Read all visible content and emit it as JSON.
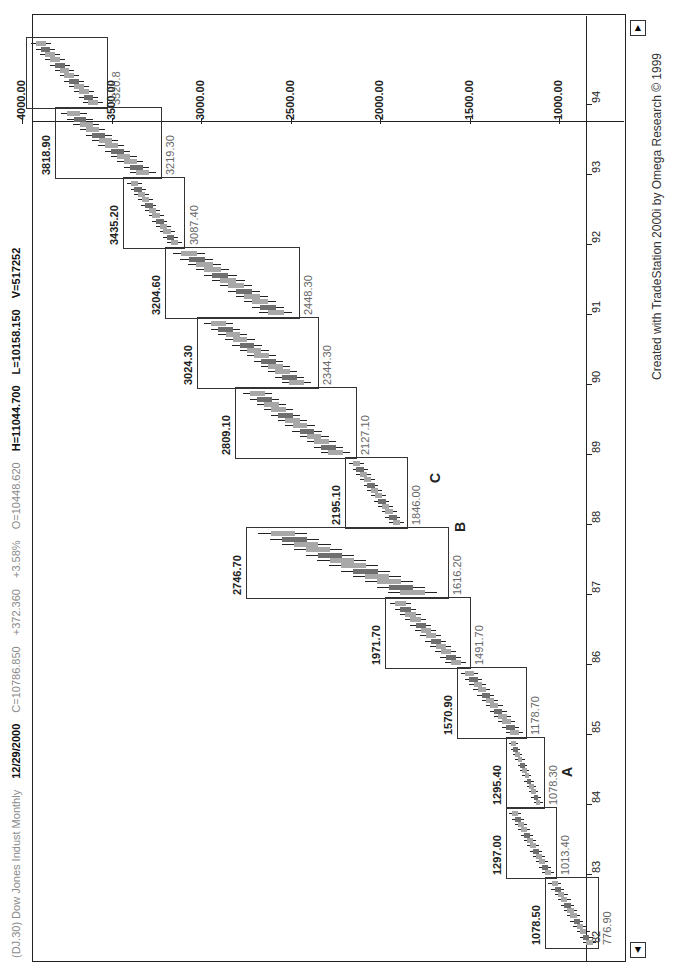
{
  "header": {
    "symbol": "(DJ.30) Dow Jones Indust Monthly",
    "date": "12/29/2000",
    "close": "C=10786.850",
    "change": "+372.360",
    "pct": "+3.58%",
    "open": "O=10448.620",
    "high": "H=11044.700",
    "low": "L=10158.150",
    "volume": "V=517252"
  },
  "footer": {
    "credit": "Created with TradeStation 2000i by Omega Research © 1999"
  },
  "colors": {
    "bar_light": "#a8a8a8",
    "bar_dark": "#6f6f6f",
    "wick": "#222222",
    "box": "#333333"
  },
  "chart_data": {
    "type": "bar",
    "title": "(DJ.30) Dow Jones Indust Monthly",
    "xlabel": "Year",
    "ylabel": "Price",
    "ylim": [
      850,
      4100
    ],
    "x_ticks": [
      "82",
      "83",
      "84",
      "85",
      "86",
      "87",
      "88",
      "89",
      "90",
      "91",
      "92",
      "93",
      "94"
    ],
    "y_ticks": [
      "1000.00",
      "1500.00",
      "2000.00",
      "2500.00",
      "3000.00",
      "3500.00",
      "4000.00"
    ],
    "legend": [],
    "boxes": [
      {
        "period": "1982-1983",
        "high": 1078.5,
        "low": 776.9,
        "high_label": "1078.50",
        "low_label": "776.90"
      },
      {
        "period": "1983",
        "high": 1297.0,
        "low": 1013.4,
        "high_label": "1297.00",
        "low_label": "1013.40"
      },
      {
        "period": "1984",
        "high": 1295.4,
        "low": 1078.3,
        "high_label": "1295.40",
        "low_label": "1078.30"
      },
      {
        "period": "1985",
        "high": 1570.9,
        "low": 1178.7,
        "high_label": "1570.90",
        "low_label": "1178.70"
      },
      {
        "period": "1986",
        "high": 1971.7,
        "low": 1491.7,
        "high_label": "1971.70",
        "low_label": "1491.70"
      },
      {
        "period": "1987",
        "high": 2746.7,
        "low": 1616.2,
        "high_label": "2746.70",
        "low_label": "1616.20"
      },
      {
        "period": "1988",
        "high": 2195.1,
        "low": 1846.0,
        "high_label": "2195.10",
        "low_label": "1846.00"
      },
      {
        "period": "1989",
        "high": 2809.1,
        "low": 2127.1,
        "high_label": "2809.10",
        "low_label": "2127.10"
      },
      {
        "period": "1990",
        "high": 3024.3,
        "low": 2344.3,
        "high_label": "3024.30",
        "low_label": "2344.30"
      },
      {
        "period": "1991",
        "high": 3204.6,
        "low": 2448.3,
        "high_label": "3204.60",
        "low_label": "2448.30"
      },
      {
        "period": "1992",
        "high": 3435.2,
        "low": 3087.4,
        "high_label": "3435.20",
        "low_label": "3087.40"
      },
      {
        "period": "1993",
        "high": 3818.9,
        "low": 3219.3,
        "high_label": "3818.90",
        "low_label": "3219.30"
      },
      {
        "period": "1994",
        "high": 3978.4,
        "low": 3520.8,
        "high_label": "",
        "low_label": "3520.8"
      }
    ],
    "annotations": [
      {
        "text": "A",
        "year": 1984.4,
        "price": 1000
      },
      {
        "text": "B",
        "year": 1987.9,
        "price": 1600
      },
      {
        "text": "C",
        "year": 1988.6,
        "price": 1740
      }
    ]
  }
}
